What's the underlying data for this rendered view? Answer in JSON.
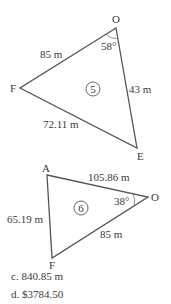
{
  "diagram": {
    "triangle_5": {
      "region_label": "5",
      "vertices": {
        "O": "O",
        "F": "F",
        "E": "E"
      },
      "sides": {
        "OF": "85 m",
        "OE": "43 m",
        "FE": "72.11 m"
      },
      "angle_O": "58°"
    },
    "triangle_6": {
      "region_label": "6",
      "vertices": {
        "A": "A",
        "O": "O",
        "F": "F"
      },
      "sides": {
        "AO": "105.86 m",
        "AF": "65.19 m",
        "OF": "85 m"
      },
      "angle_O": "38°"
    }
  },
  "answers": {
    "c": "c. 840.85 m",
    "d": "d. $3784.50"
  },
  "colors": {
    "line": "#555555",
    "text": "#3a3a3a"
  }
}
